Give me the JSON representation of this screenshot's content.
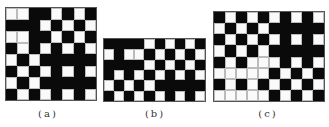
{
  "figures": [
    {
      "id": "a",
      "label": "(a)",
      "rows": 8,
      "cols": 8,
      "cells": [
        "WWBBWBWB",
        "BBBWBWBW",
        "WWBBWBWB",
        "BWBWBWBW",
        "WBWBBBBB",
        "BWBWBWBW",
        "WBWBBBBB",
        "BWBWBWBW"
      ]
    },
    {
      "id": "b",
      "label": "(b)",
      "rows": 6,
      "cols": 10,
      "cells": [
        "BBBBWBWBWB",
        "WBWWBWBWBW",
        "BBBBWBWBWB",
        "BWBWBWBWBW",
        "WBWBWBBBBB",
        "BWBWBWBWBW"
      ]
    },
    {
      "id": "c",
      "label": "(c)",
      "rows": 8,
      "cols": 10,
      "cells": [
        "BWBWBWBWBW",
        "WBWBWBBBBB",
        "BWBWBWBWBW",
        "WBWBWBBBBB",
        "BWBWWWBWBW",
        "WWWWWBWBWB",
        "BWBWBWBWBW",
        "WWWWWBWBWB"
      ]
    }
  ],
  "colors": {
    "black": "#0a0a0a",
    "white": "#fafafa",
    "grid_line": "#bbbbbb"
  }
}
